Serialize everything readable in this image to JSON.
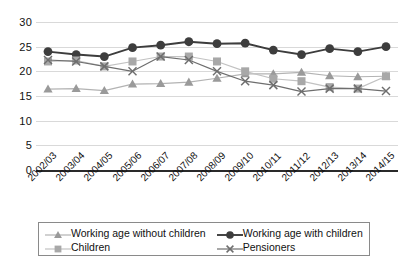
{
  "chart_data": {
    "type": "line",
    "title": "",
    "subtitle": "",
    "xlabel": "",
    "ylabel": "",
    "ylim": [
      0,
      30
    ],
    "yticks": [
      0,
      5,
      10,
      15,
      20,
      25,
      30
    ],
    "grid": true,
    "legend_position": "bottom",
    "categories": [
      "2002/03",
      "2003/04",
      "2004/05",
      "2005/06",
      "2006/07",
      "2007/08",
      "2008/09",
      "2009/10",
      "2010/11",
      "2011/12",
      "2012/13",
      "2013/14",
      "2014/15"
    ],
    "series": [
      {
        "name": "Working age without children",
        "marker": "triangle",
        "color": "#9a9a9a",
        "line_color": "#b3b3b3",
        "values": [
          16.4,
          16.5,
          16.1,
          17.4,
          17.5,
          17.8,
          18.6,
          19.5,
          19.5,
          19.8,
          19.1,
          18.9,
          19.0
        ]
      },
      {
        "name": "Working age with children",
        "marker": "circle",
        "color": "#3d3d3d",
        "line_color": "#3d3d3d",
        "values": [
          24.0,
          23.4,
          23.0,
          24.8,
          25.3,
          26.0,
          25.6,
          25.7,
          24.3,
          23.4,
          24.6,
          24.0,
          25.0
        ]
      },
      {
        "name": "Children",
        "marker": "square",
        "color": "#a8a8a8",
        "line_color": "#c2c2c2",
        "values": [
          22.0,
          22.2,
          21.0,
          22.0,
          23.0,
          23.0,
          22.0,
          20.0,
          18.5,
          18.0,
          16.8,
          16.5,
          19.0
        ]
      },
      {
        "name": "Pensioners",
        "marker": "x",
        "color": "#6e6e6e",
        "line_color": "#6e6e6e",
        "values": [
          22.3,
          22.0,
          21.0,
          20.0,
          23.0,
          22.3,
          20.0,
          18.0,
          17.2,
          15.9,
          16.5,
          16.5,
          16.0
        ]
      }
    ]
  },
  "axis": {
    "y_tick_labels": [
      "30",
      "25",
      "20",
      "15",
      "10",
      "5",
      "0"
    ]
  },
  "legend": {
    "items": [
      {
        "label": "Working age without children",
        "marker": "triangle"
      },
      {
        "label": "Working age with children",
        "marker": "circle"
      },
      {
        "label": "Children",
        "marker": "square"
      },
      {
        "label": "Pensioners",
        "marker": "x"
      }
    ]
  }
}
